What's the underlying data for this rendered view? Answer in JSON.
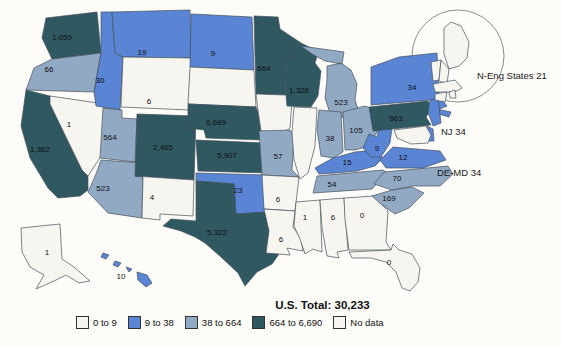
{
  "chart_data": {
    "type": "choropleth",
    "title": "",
    "us_total_label": "U.S. Total: 30,233",
    "us_total_value": 30233,
    "legend_position": "bottom",
    "legend": [
      {
        "label": "0 to 9",
        "color": "#F7F5EF"
      },
      {
        "label": "9 to 38",
        "color": "#5A84D4"
      },
      {
        "label": "38 to 664",
        "color": "#92A9C4"
      },
      {
        "label": "664 to 6,690",
        "color": "#2F5861"
      },
      {
        "label": "No data",
        "color": "#F7F5EF"
      }
    ],
    "annotations": [
      {
        "id": "neng",
        "text": "N-Eng States  21"
      },
      {
        "id": "nj",
        "text": "NJ  34"
      },
      {
        "id": "demd",
        "text": "DE-MD  34"
      }
    ],
    "states": [
      {
        "id": "WA",
        "name": "Washington",
        "value": "1,059",
        "category": "664 to 6,690"
      },
      {
        "id": "OR",
        "name": "Oregon",
        "value": "66",
        "category": "38 to 664"
      },
      {
        "id": "CA",
        "name": "California",
        "value": "1,362",
        "category": "664 to 6,690"
      },
      {
        "id": "NV",
        "name": "Nevada",
        "value": "1",
        "category": "0 to 9"
      },
      {
        "id": "ID",
        "name": "Idaho",
        "value": "30",
        "category": "9 to 38"
      },
      {
        "id": "MT",
        "name": "Montana",
        "value": "19",
        "category": "9 to 38"
      },
      {
        "id": "WY",
        "name": "Wyoming",
        "value": "6",
        "category": "0 to 9"
      },
      {
        "id": "UT",
        "name": "Utah",
        "value": "564",
        "category": "38 to 664"
      },
      {
        "id": "AZ",
        "name": "Arizona",
        "value": "523",
        "category": "38 to 664"
      },
      {
        "id": "CO",
        "name": "Colorado",
        "value": "2,465",
        "category": "664 to 6,690"
      },
      {
        "id": "NM",
        "name": "New Mexico",
        "value": "4",
        "category": "0 to 9"
      },
      {
        "id": "ND",
        "name": "North Dakota",
        "value": "9",
        "category": "9 to 38"
      },
      {
        "id": "SD",
        "name": "South Dakota",
        "value": "",
        "category": "No data"
      },
      {
        "id": "NE",
        "name": "Nebraska",
        "value": "6,689",
        "category": "664 to 6,690"
      },
      {
        "id": "KS",
        "name": "Kansas",
        "value": "5,907",
        "category": "664 to 6,690"
      },
      {
        "id": "OK",
        "name": "Oklahoma",
        "value": "23",
        "category": "9 to 38"
      },
      {
        "id": "TX",
        "name": "Texas",
        "value": "5,322",
        "category": "664 to 6,690"
      },
      {
        "id": "MN",
        "name": "Minnesota",
        "value": "664",
        "category": "664 to 6,690"
      },
      {
        "id": "IA",
        "name": "Iowa",
        "value": "",
        "category": "No data"
      },
      {
        "id": "MO",
        "name": "Missouri",
        "value": "57",
        "category": "38 to 664"
      },
      {
        "id": "AR",
        "name": "Arkansas",
        "value": "6",
        "category": "0 to 9"
      },
      {
        "id": "LA",
        "name": "Louisiana",
        "value": "6",
        "category": "0 to 9"
      },
      {
        "id": "WI",
        "name": "Wisconsin",
        "value": "1,326",
        "category": "664 to 6,690"
      },
      {
        "id": "IL",
        "name": "Illinois",
        "value": "",
        "category": "No data"
      },
      {
        "id": "MI",
        "name": "Michigan",
        "value": "523",
        "category": "38 to 664"
      },
      {
        "id": "IN",
        "name": "Indiana",
        "value": "38",
        "category": "38 to 664"
      },
      {
        "id": "OH",
        "name": "Ohio",
        "value": "105",
        "category": "38 to 664"
      },
      {
        "id": "KY",
        "name": "Kentucky",
        "value": "15",
        "category": "9 to 38"
      },
      {
        "id": "TN",
        "name": "Tennessee",
        "value": "54",
        "category": "38 to 664"
      },
      {
        "id": "MS",
        "name": "Mississippi",
        "value": "1",
        "category": "0 to 9"
      },
      {
        "id": "AL",
        "name": "Alabama",
        "value": "6",
        "category": "0 to 9"
      },
      {
        "id": "GA",
        "name": "Georgia",
        "value": "0",
        "category": "0 to 9"
      },
      {
        "id": "FL",
        "name": "Florida",
        "value": "0",
        "category": "0 to 9"
      },
      {
        "id": "SC",
        "name": "South Carolina",
        "value": "169",
        "category": "38 to 664"
      },
      {
        "id": "NC",
        "name": "North Carolina",
        "value": "70",
        "category": "38 to 664"
      },
      {
        "id": "VA",
        "name": "Virginia",
        "value": "12",
        "category": "9 to 38"
      },
      {
        "id": "WV",
        "name": "West Virginia",
        "value": "9",
        "category": "9 to 38"
      },
      {
        "id": "PA",
        "name": "Pennsylvania",
        "value": "963",
        "category": "664 to 6,690"
      },
      {
        "id": "NY",
        "name": "New York",
        "value": "34",
        "category": "9 to 38"
      },
      {
        "id": "NJ",
        "name": "New Jersey",
        "value": "34",
        "category": "9 to 38",
        "label_external": true,
        "annotation": "NJ  34"
      },
      {
        "id": "DE",
        "name": "Delaware",
        "value": "",
        "category": "9 to 38",
        "group": "DE-MD  34"
      },
      {
        "id": "MD",
        "name": "Maryland",
        "value": "",
        "category": "",
        "group": "DE-MD  34"
      },
      {
        "id": "ME",
        "name": "Maine",
        "value": "",
        "category": "",
        "group": "N-Eng States  21"
      },
      {
        "id": "VT",
        "name": "Vermont",
        "value": "",
        "category": "",
        "group": "N-Eng States  21"
      },
      {
        "id": "NH",
        "name": "New Hampshire",
        "value": "",
        "category": "",
        "group": "N-Eng States  21"
      },
      {
        "id": "MA",
        "name": "Massachusetts",
        "value": "",
        "category": "",
        "group": "N-Eng States  21"
      },
      {
        "id": "CT",
        "name": "Connecticut",
        "value": "",
        "category": "",
        "group": "N-Eng States  21"
      },
      {
        "id": "RI",
        "name": "Rhode Island",
        "value": "",
        "category": "",
        "group": "N-Eng States  21"
      },
      {
        "id": "AK",
        "name": "Alaska",
        "value": "1",
        "category": "0 to 9"
      },
      {
        "id": "HI",
        "name": "Hawaii",
        "value": "10",
        "category": "9 to 38"
      }
    ]
  }
}
